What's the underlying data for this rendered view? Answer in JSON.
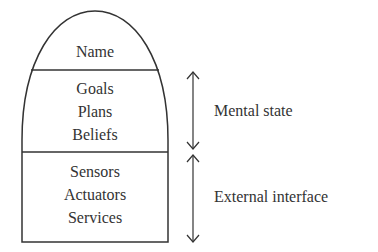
{
  "diagram": {
    "shape": {
      "sections": [
        {
          "id": "name",
          "items": [
            "Name"
          ]
        },
        {
          "id": "mental",
          "items": [
            "Goals",
            "Plans",
            "Beliefs"
          ]
        },
        {
          "id": "external",
          "items": [
            "Sensors",
            "Actuators",
            "Services"
          ]
        }
      ]
    },
    "annotations": [
      {
        "label": "Mental state",
        "spans": "mental"
      },
      {
        "label": "External interface",
        "spans": "external"
      }
    ],
    "colors": {
      "stroke": "#333333",
      "text": "#333333",
      "background": "#ffffff"
    }
  }
}
